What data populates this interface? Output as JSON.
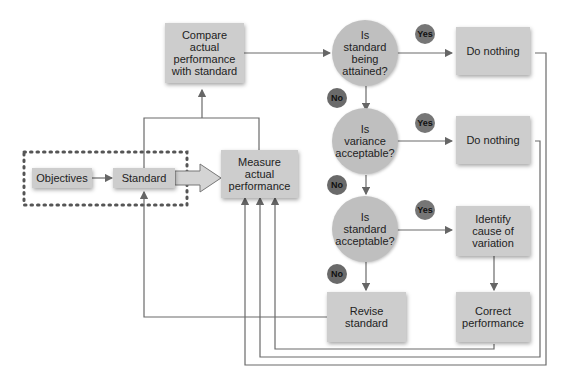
{
  "diagram": {
    "title": "",
    "nodes": {
      "objectives": "Objectives",
      "standard": "Standard",
      "measure": "Measure\nactual\nperformance",
      "compare": "Compare\nactual\nperformance\nwith standard",
      "q1": "Is\nstandard\nbeing\nattained?",
      "q2": "Is\nvariance\nacceptable?",
      "q3": "Is\nstandard\nacceptable?",
      "do_nothing_1": "Do nothing",
      "do_nothing_2": "Do nothing",
      "identify": "Identify\ncause of\nvariation",
      "correct": "Correct\nperformance",
      "revise": "Revise\nstandard"
    },
    "labels": {
      "yes": "Yes",
      "no": "No"
    },
    "colors": {
      "box_fill": "#cdcdcd",
      "circle_fill": "#bfbfbf",
      "badge_fill": "#6f6f6f",
      "line": "#666666"
    }
  }
}
